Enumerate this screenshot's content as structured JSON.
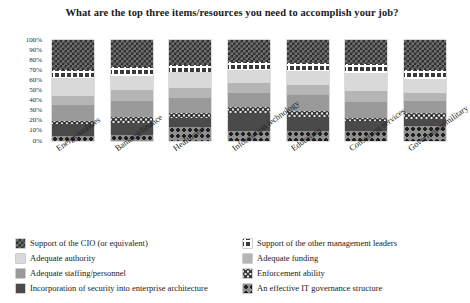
{
  "chart_data": {
    "type": "bar",
    "stacked": true,
    "stack_mode": "percent",
    "title": "What are the top three items/resources you need to accomplish your job?",
    "xlabel": "",
    "ylabel": "",
    "ylim": [
      0,
      100
    ],
    "ytick_labels": [
      "100%",
      "90%",
      "80%",
      "70%",
      "60%",
      "50%",
      "40%",
      "30%",
      "20%",
      "10%",
      "0%"
    ],
    "ytick_values": [
      100,
      90,
      80,
      70,
      60,
      50,
      40,
      30,
      20,
      10,
      0
    ],
    "grid": false,
    "legend_position": "bottom",
    "categories": [
      "Energy/utilities",
      "Banking/finance",
      "Healthcare",
      "Information technology",
      "Education",
      "Consulting services",
      "Government/military"
    ],
    "series": [
      {
        "name": "Support of the CIO (or equivalent)",
        "pattern": "checkerboard",
        "color": "#6f6f6f",
        "values": [
          30,
          27,
          25,
          22,
          23,
          24,
          30
        ]
      },
      {
        "name": "Support of the other management leaders",
        "pattern": "white-grid-on-dark",
        "color": "#3a3a3a",
        "values": [
          8,
          9,
          7,
          8,
          8,
          9,
          9
        ]
      },
      {
        "name": "Adequate authority",
        "pattern": "solid-light-gray",
        "color": "#d9d9d9",
        "values": [
          17,
          14,
          16,
          13,
          14,
          18,
          13
        ]
      },
      {
        "name": "Adequate funding",
        "pattern": "solid-medium-gray",
        "color": "#b5b5b5",
        "values": [
          9,
          10,
          9,
          9,
          9,
          10,
          8
        ]
      },
      {
        "name": "Adequate staffing/personnel",
        "pattern": "solid-gray",
        "color": "#9a9a9a",
        "values": [
          16,
          16,
          15,
          14,
          16,
          16,
          12
        ]
      },
      {
        "name": "Enforcement ability",
        "pattern": "speckled",
        "color": "#e8e8e8",
        "values": [
          3,
          6,
          5,
          6,
          6,
          3,
          6
        ]
      },
      {
        "name": "Incorporation of security into enterprise architecture",
        "pattern": "solid-dark-gray",
        "color": "#4a4a4a",
        "values": [
          12,
          12,
          9,
          18,
          14,
          10,
          7
        ]
      },
      {
        "name": "An effective IT governance structure",
        "pattern": "dotted",
        "color": "#8f8f8f",
        "values": [
          5,
          6,
          14,
          10,
          10,
          10,
          15
        ]
      }
    ]
  },
  "legend": {
    "left_items": [
      "Support of the CIO (or equivalent)",
      "Adequate authority",
      "Adequate staffing/personnel",
      "Incorporation of security into enterprise architecture"
    ],
    "right_items": [
      "Support of the other management leaders",
      "Adequate funding",
      "Enforcement ability",
      "An effective IT governance structure"
    ]
  }
}
